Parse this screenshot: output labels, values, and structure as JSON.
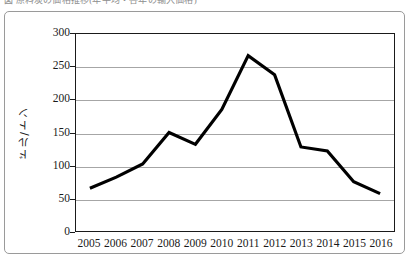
{
  "caption": {
    "text": "図 原料炭の価格推移(年平均・各年の輸入価格)"
  },
  "axis": {
    "y_title": "ドル/トン",
    "y_ticks": [
      "0",
      "50",
      "100",
      "150",
      "200",
      "250",
      "300"
    ],
    "x_ticks": [
      "2005",
      "2006",
      "2007",
      "2008",
      "2009",
      "2010",
      "2011",
      "2012",
      "2013",
      "2014",
      "2015",
      "2016"
    ]
  },
  "style": {
    "line_color": "#000000",
    "grid_color": "#a6a6a6",
    "frame_color": "#1a1a1a",
    "outer_frame_color": "#9a9a9a",
    "background": "#ffffff"
  },
  "chart_data": {
    "type": "line",
    "title": "",
    "xlabel": "",
    "ylabel": "ドル/トン",
    "categories": [
      "2005",
      "2006",
      "2007",
      "2008",
      "2009",
      "2010",
      "2011",
      "2012",
      "2013",
      "2014",
      "2015",
      "2016"
    ],
    "values": [
      65,
      82,
      102,
      150,
      132,
      185,
      267,
      238,
      128,
      122,
      75,
      57
    ],
    "ylim": [
      0,
      300
    ],
    "ytick_step": 50,
    "grid": "horizontal",
    "legend": "none",
    "series": [
      {
        "name": "価格",
        "values": [
          65,
          82,
          102,
          150,
          132,
          185,
          267,
          238,
          128,
          122,
          75,
          57
        ]
      }
    ]
  }
}
